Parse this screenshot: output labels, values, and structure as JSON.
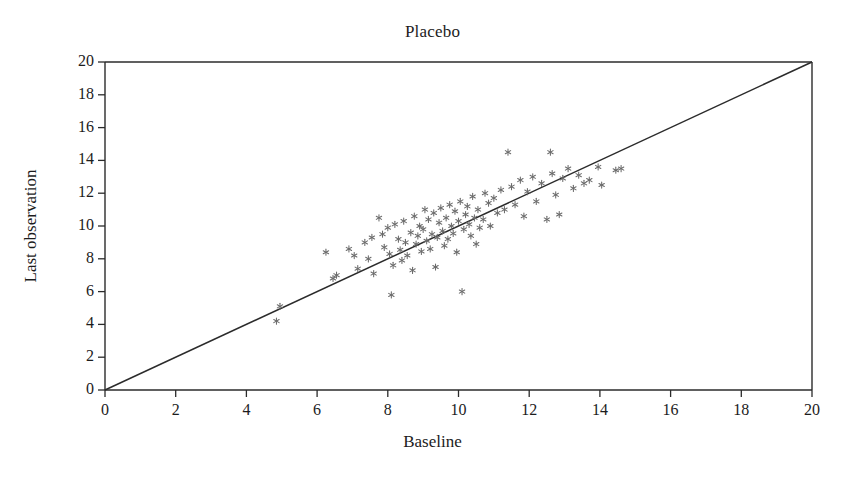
{
  "chart_data": {
    "type": "scatter",
    "title": "Placebo",
    "xlabel": "Baseline",
    "ylabel": "Last observation",
    "xlim": [
      0,
      20
    ],
    "ylim": [
      0,
      20
    ],
    "xticks": [
      0,
      2,
      4,
      6,
      8,
      10,
      12,
      14,
      16,
      18,
      20
    ],
    "yticks": [
      0,
      2,
      4,
      6,
      8,
      10,
      12,
      14,
      16,
      18,
      20
    ],
    "grid": false,
    "legend": "none",
    "marker": "asterisk",
    "marker_color": "#6b6b6b",
    "axis_color": "#2b2b2b",
    "reference_line": {
      "label": "identity line y = x",
      "from": [
        0,
        0
      ],
      "to": [
        20,
        20
      ],
      "color": "#2b2b2b"
    },
    "series": [
      {
        "name": "Patients",
        "points": [
          [
            4.85,
            4.2
          ],
          [
            4.95,
            5.1
          ],
          [
            6.25,
            8.4
          ],
          [
            6.45,
            6.8
          ],
          [
            6.55,
            7.0
          ],
          [
            6.9,
            8.6
          ],
          [
            7.05,
            8.2
          ],
          [
            7.15,
            7.4
          ],
          [
            7.35,
            9.0
          ],
          [
            7.45,
            8.0
          ],
          [
            7.55,
            9.3
          ],
          [
            7.6,
            7.1
          ],
          [
            7.75,
            10.5
          ],
          [
            7.85,
            9.5
          ],
          [
            7.9,
            8.7
          ],
          [
            8.0,
            9.9
          ],
          [
            8.05,
            8.3
          ],
          [
            8.1,
            5.8
          ],
          [
            8.15,
            7.6
          ],
          [
            8.2,
            10.1
          ],
          [
            8.3,
            9.2
          ],
          [
            8.35,
            8.55
          ],
          [
            8.4,
            7.9
          ],
          [
            8.45,
            10.3
          ],
          [
            8.5,
            9.0
          ],
          [
            8.55,
            8.2
          ],
          [
            8.65,
            9.6
          ],
          [
            8.7,
            7.3
          ],
          [
            8.75,
            10.6
          ],
          [
            8.8,
            8.9
          ],
          [
            8.85,
            9.4
          ],
          [
            8.9,
            10.0
          ],
          [
            8.95,
            8.45
          ],
          [
            9.0,
            9.8
          ],
          [
            9.05,
            11.0
          ],
          [
            9.1,
            9.1
          ],
          [
            9.15,
            10.4
          ],
          [
            9.2,
            8.6
          ],
          [
            9.25,
            9.5
          ],
          [
            9.3,
            10.8
          ],
          [
            9.35,
            7.5
          ],
          [
            9.4,
            9.3
          ],
          [
            9.45,
            10.2
          ],
          [
            9.5,
            11.1
          ],
          [
            9.55,
            9.7
          ],
          [
            9.6,
            8.8
          ],
          [
            9.65,
            10.5
          ],
          [
            9.7,
            9.2
          ],
          [
            9.75,
            11.3
          ],
          [
            9.8,
            10.0
          ],
          [
            9.85,
            9.55
          ],
          [
            9.9,
            10.9
          ],
          [
            9.95,
            8.4
          ],
          [
            10.0,
            10.3
          ],
          [
            10.05,
            11.5
          ],
          [
            10.1,
            6.0
          ],
          [
            10.15,
            9.8
          ],
          [
            10.2,
            10.7
          ],
          [
            10.25,
            11.2
          ],
          [
            10.3,
            10.1
          ],
          [
            10.35,
            9.4
          ],
          [
            10.4,
            11.8
          ],
          [
            10.45,
            10.5
          ],
          [
            10.5,
            8.9
          ],
          [
            10.55,
            11.0
          ],
          [
            10.6,
            9.9
          ],
          [
            10.7,
            10.4
          ],
          [
            10.75,
            12.0
          ],
          [
            10.85,
            11.4
          ],
          [
            10.9,
            10.0
          ],
          [
            11.0,
            11.7
          ],
          [
            11.1,
            10.8
          ],
          [
            11.2,
            12.2
          ],
          [
            11.3,
            11.0
          ],
          [
            11.4,
            14.5
          ],
          [
            11.5,
            12.4
          ],
          [
            11.6,
            11.3
          ],
          [
            11.75,
            12.8
          ],
          [
            11.85,
            10.6
          ],
          [
            11.95,
            12.1
          ],
          [
            12.1,
            13.0
          ],
          [
            12.2,
            11.5
          ],
          [
            12.35,
            12.6
          ],
          [
            12.5,
            10.4
          ],
          [
            12.6,
            14.5
          ],
          [
            12.65,
            13.2
          ],
          [
            12.75,
            11.9
          ],
          [
            12.85,
            10.7
          ],
          [
            12.95,
            12.9
          ],
          [
            13.1,
            13.5
          ],
          [
            13.25,
            12.3
          ],
          [
            13.4,
            13.1
          ],
          [
            13.55,
            12.6
          ],
          [
            13.7,
            12.8
          ],
          [
            13.95,
            13.6
          ],
          [
            14.05,
            12.5
          ],
          [
            14.45,
            13.4
          ],
          [
            14.6,
            13.5
          ]
        ]
      }
    ]
  },
  "plot_geometry": {
    "left": 105,
    "top": 62,
    "right": 812,
    "bottom": 390
  }
}
